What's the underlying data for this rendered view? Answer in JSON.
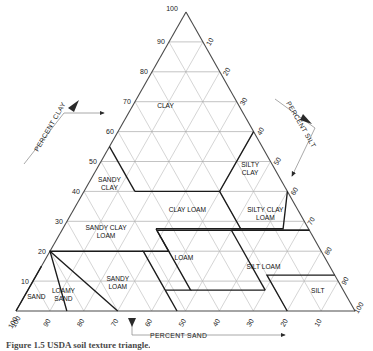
{
  "figure": {
    "title": "USDA Soil Texture Triangle",
    "caption": "Figure 1.5    USDA soil texture triangle.",
    "caption_clipped": true
  },
  "geometry": {
    "apex": [
      186,
      12
    ],
    "bottom_left": [
      16,
      311
    ],
    "bottom_right": [
      355,
      311
    ],
    "tick_step": 10
  },
  "axes": {
    "left": {
      "name": "percent-clay-axis",
      "title": "PERCENT CLAY",
      "ticks": [
        "100",
        "90",
        "80",
        "70",
        "60",
        "50",
        "40",
        "30",
        "20",
        "10"
      ],
      "direction": "upward-along-left-edge"
    },
    "right": {
      "name": "percent-silt-axis",
      "title": "PERCENT SILT",
      "ticks": [
        "10",
        "20",
        "30",
        "40",
        "50",
        "60",
        "70",
        "80",
        "90",
        "100"
      ],
      "direction": "downward-along-right-edge"
    },
    "bottom": {
      "name": "percent-sand-axis",
      "title": "PERCENT SAND",
      "ticks": [
        "100",
        "90",
        "80",
        "70",
        "60",
        "50",
        "40",
        "30",
        "20",
        "10"
      ],
      "direction": "right-to-left-along-bottom-edge"
    },
    "apex_label": "100"
  },
  "chart_data": {
    "type": "ternary-diagram",
    "title": "USDA Soil Texture Triangle",
    "axis_labels": {
      "left": "PERCENT CLAY",
      "right": "PERCENT SILT",
      "bottom": "PERCENT SAND"
    },
    "axis_range": [
      0,
      100
    ],
    "grid": true,
    "grid_step": 10,
    "legend": "none",
    "classes": [
      {
        "name": "CLAY",
        "label_lines": [
          "CLAY"
        ],
        "label_clay": 68,
        "label_sand": 22
      },
      {
        "name": "SILTY CLAY",
        "label_lines": [
          "SILTY",
          "CLAY"
        ],
        "label_clay": 48,
        "label_sand": 7
      },
      {
        "name": "SANDY CLAY",
        "label_lines": [
          "SANDY",
          "CLAY"
        ],
        "label_clay": 43,
        "label_sand": 51
      },
      {
        "name": "CLAY LOAM",
        "label_lines": [
          "CLAY LOAM"
        ],
        "label_clay": 33,
        "label_sand": 33
      },
      {
        "name": "SILTY CLAY LOAM",
        "label_lines": [
          "SILTY CLAY",
          "LOAM"
        ],
        "label_clay": 33,
        "label_sand": 10
      },
      {
        "name": "SANDY CLAY LOAM",
        "label_lines": [
          "SANDY CLAY",
          "LOAM"
        ],
        "label_clay": 27,
        "label_sand": 60
      },
      {
        "name": "LOAM",
        "label_lines": [
          "LOAM"
        ],
        "label_clay": 17,
        "label_sand": 42
      },
      {
        "name": "SILT LOAM",
        "label_lines": [
          "SILT LOAM"
        ],
        "label_clay": 14,
        "label_sand": 20
      },
      {
        "name": "SANDY LOAM",
        "label_lines": [
          "SANDY",
          "LOAM"
        ],
        "label_clay": 10,
        "label_sand": 65
      },
      {
        "name": "SILT",
        "label_lines": [
          "SILT"
        ],
        "label_clay": 6,
        "label_sand": 8
      },
      {
        "name": "LOAMY SAND",
        "label_lines": [
          "LOAMY",
          "SAND"
        ],
        "label_clay": 6,
        "label_sand": 83
      },
      {
        "name": "SAND",
        "label_lines": [
          "SAND"
        ],
        "label_clay": 4,
        "label_sand": 92
      }
    ]
  },
  "annotations": {
    "clay_arrow": "arrow-up-right",
    "silt_arrow": "arrow-down-right",
    "sand_arrow": "arrow-right"
  }
}
